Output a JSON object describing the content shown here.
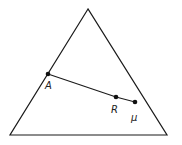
{
  "diagram": {
    "type": "simplex-triangle",
    "triangle": {
      "vertices": [
        {
          "x": 88,
          "y": 9
        },
        {
          "x": 10,
          "y": 135
        },
        {
          "x": 167,
          "y": 135
        }
      ]
    },
    "points": [
      {
        "id": "A",
        "label": "A",
        "x": 48,
        "y": 74,
        "label_x": 45,
        "label_y": 89
      },
      {
        "id": "R",
        "label": "R",
        "x": 116,
        "y": 97,
        "label_x": 111,
        "label_y": 113
      },
      {
        "id": "mu",
        "label": "μ",
        "x": 135,
        "y": 102,
        "label_x": 131,
        "label_y": 121
      }
    ],
    "segments": [
      {
        "from": "A",
        "to": "R"
      },
      {
        "from": "R",
        "to": "mu"
      }
    ],
    "colors": {
      "stroke": "#1a1a1a",
      "background": "#ffffff"
    }
  }
}
